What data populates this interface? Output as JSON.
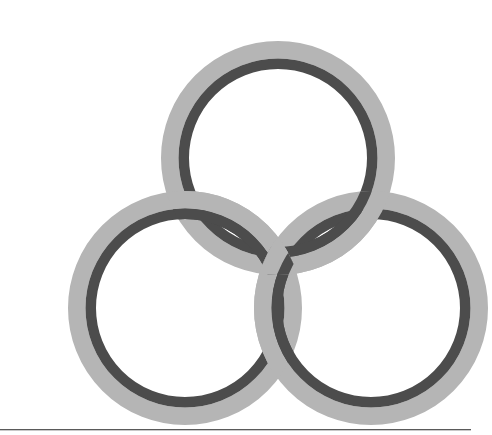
{
  "page": {
    "width": 471,
    "height": 435,
    "background_color": "#ffffff",
    "type": "logo-graphic",
    "title": "Three interlocking rings logo"
  },
  "graphic": {
    "name": "trefoil-interlocking-rings",
    "description": "Three equal interlocking rings arranged in a triangle, each drawn as a thick light-gray annulus with a thinner dark-gray annulus inside it, woven over and under one another",
    "ring_count": 3,
    "colors": {
      "outer_band": "#b5b5b5",
      "inner_band": "#4c4c4c",
      "hole": "#ffffff",
      "background": "#ffffff",
      "rule": "#5a5a5a"
    },
    "geometry": {
      "outer_radius": 117,
      "outer_band_inner_radius": 99.5,
      "dark_band_outer_radius": 99.5,
      "dark_band_inner_radius": 89,
      "stroke_width_outer": 17.5,
      "stroke_width_inner": 10.5
    },
    "rings": [
      {
        "id": "top",
        "label": "Top ring",
        "cx": 238,
        "cy": 142
      },
      {
        "id": "left",
        "label": "Lower-left ring",
        "cx": 145,
        "cy": 292
      },
      {
        "id": "right",
        "label": "Lower-right ring",
        "cx": 331,
        "cy": 292
      }
    ],
    "weave_order": [
      "left-over-top",
      "top-over-right",
      "right-over-left"
    ]
  },
  "footer": {
    "rule_visible": true,
    "rule_y": 429
  }
}
